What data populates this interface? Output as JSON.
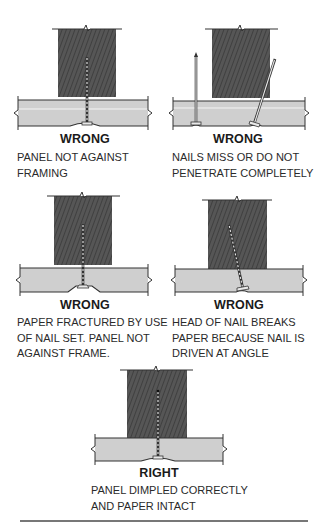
{
  "colors": {
    "stud": "#545454",
    "stud_hatch": "#3e3e3e",
    "board": "#cfcfcf",
    "line": "#333333",
    "nail": "#e8e8e8"
  },
  "panels": [
    {
      "verdict": "WRONG",
      "caption_lines": [
        "PANEL NOT AGAINST",
        "FRAMING"
      ],
      "description": "Gap between panel and stud; nail straight"
    },
    {
      "verdict": "WRONG",
      "caption_lines": [
        "NAILS MISS OR DO NOT",
        "PENETRATE COMPLETELY"
      ],
      "description": "One nail misses stud, one angled nail partially penetrates"
    },
    {
      "verdict": "WRONG",
      "caption_lines": [
        "PAPER FRACTURED BY USE",
        "OF NAIL SET. PANEL NOT",
        "AGAINST FRAME."
      ],
      "description": "Nail head over-driven, fracturing face paper"
    },
    {
      "verdict": "WRONG",
      "caption_lines": [
        "HEAD OF NAIL BREAKS",
        "PAPER BECAUSE NAIL IS",
        "DRIVEN AT ANGLE"
      ],
      "description": "Angled nail head breaks paper"
    },
    {
      "verdict": "RIGHT",
      "caption_lines": [
        "PANEL DIMPLED CORRECTLY",
        "AND PAPER INTACT"
      ],
      "description": "Nail straight, panel dimpled, paper intact"
    }
  ]
}
